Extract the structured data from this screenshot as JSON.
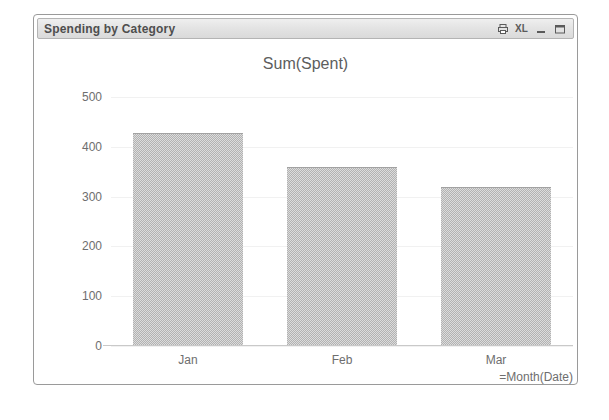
{
  "window": {
    "title": "Spending by Category",
    "controls": [
      {
        "name": "print-icon",
        "label": ""
      },
      {
        "name": "excel-export-icon",
        "label": "XL"
      },
      {
        "name": "minimize-icon",
        "label": ""
      },
      {
        "name": "maximize-icon",
        "label": ""
      }
    ]
  },
  "chart_data": {
    "type": "bar",
    "title": "Sum(Spent)",
    "xlabel": "=Month(Date)",
    "ylabel": "",
    "categories": [
      "Jan",
      "Feb",
      "Mar"
    ],
    "values": [
      427,
      360,
      320
    ],
    "ylim": [
      0,
      500
    ],
    "yticks": [
      500,
      400,
      300,
      200,
      100,
      0
    ],
    "ytick_labels": [
      "500",
      "400",
      "300",
      "200",
      "100",
      "0"
    ],
    "grid": true,
    "legend": false,
    "bar_color": "#b2b2b2",
    "text_color": "#6e6e6e"
  }
}
